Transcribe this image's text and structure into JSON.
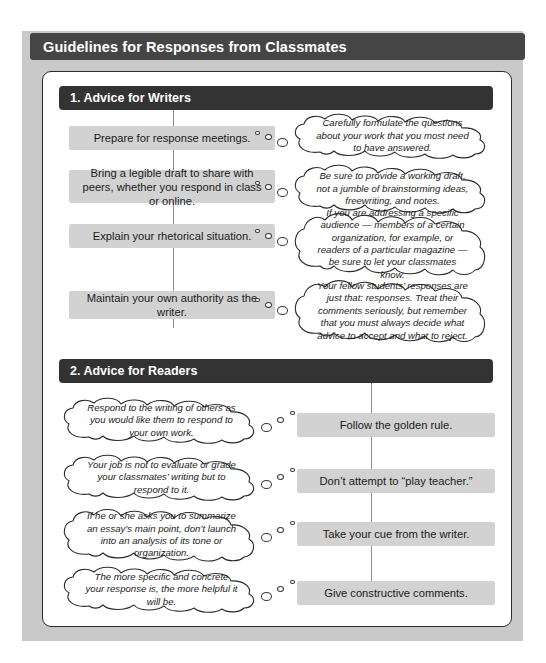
{
  "figure": {
    "title": "Guidelines for Responses from Classmates",
    "frame_color": "#c9c9c9",
    "title_bar_color": "#454545",
    "section_header_color": "#333333",
    "box_color": "#d2d2d2"
  },
  "sections": [
    {
      "id": "advice-for-writers",
      "label": "1. Advice for Writers",
      "layout": "box-left-bubble-right",
      "rows": [
        {
          "box": "Prepare for response meetings.",
          "bubble": "Carefully formulate the questions about your work that you most need to have answered."
        },
        {
          "box": "Bring a legible draft to share with peers, whether you respond in class or online.",
          "bubble": "Be sure to provide a working draft, not a jumble of brainstorming ideas, freewriting, and notes."
        },
        {
          "box": "Explain your rhetorical situation.",
          "bubble": "If you are addressing a specific audience — members of a certain organization, for example, or readers of a particular magazine — be sure to let your classmates know."
        },
        {
          "box": "Maintain your own authority as the writer.",
          "bubble": "Your fellow students’ responses are just that: responses. Treat their comments seriously, but remember that you must always decide what advice to accept and what to reject."
        }
      ]
    },
    {
      "id": "advice-for-readers",
      "label": "2. Advice for Readers",
      "layout": "bubble-left-box-right",
      "rows": [
        {
          "box": "Follow the golden rule.",
          "bubble": "Respond to the writing of others as you would like them to respond to your own work."
        },
        {
          "box": "Don’t attempt to “play teacher.”",
          "bubble": "Your job is not to evaluate or grade your classmates’ writing but to respond to it."
        },
        {
          "box": "Take your cue from the writer.",
          "bubble": "If he or she asks you to summarize an essay’s main point, don’t launch into an analysis of its tone or organization."
        },
        {
          "box": "Give constructive comments.",
          "bubble": "The more specific and concrete your response is, the more helpful it will be."
        }
      ]
    }
  ]
}
